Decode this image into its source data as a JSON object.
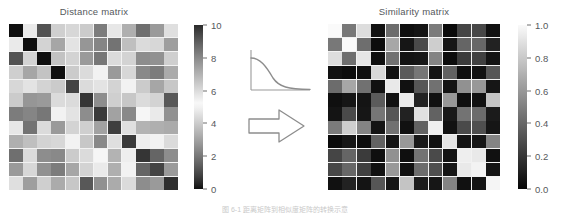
{
  "figure": {
    "caption_partial": "图 6-1 距离矩阵到相似度矩阵的转换示意"
  },
  "left_panel": {
    "title": "Distance matrix",
    "colorbar": {
      "name": "distance-colorbar",
      "ticks": [
        "10",
        "8",
        "6",
        "4",
        "2",
        "0"
      ],
      "tick_values": [
        10,
        8,
        6,
        4,
        2,
        0
      ],
      "vmin": 0,
      "vmax": 10
    }
  },
  "right_panel": {
    "title": "Similarity matrix",
    "colorbar": {
      "name": "similarity-colorbar",
      "ticks": [
        "1.0",
        "0.8",
        "0.6",
        "0.4",
        "0.2",
        "0.0"
      ],
      "tick_values": [
        1.0,
        0.8,
        0.6,
        0.4,
        0.2,
        0.0
      ],
      "vmin": 0.0,
      "vmax": 1.0
    }
  },
  "transform": {
    "kernel_icon": "decaying-kernel-curve",
    "arrow_icon": "right-block-arrow"
  },
  "chart_data": [
    {
      "type": "heatmap",
      "name": "distance-matrix",
      "title": "Distance matrix",
      "xlabel": "",
      "ylabel": "",
      "cmap": "gray-diverging-dark-light-dark",
      "vmin": 0,
      "vmax": 10,
      "colorbar_ticks": [
        0,
        2,
        4,
        6,
        8,
        10
      ],
      "rows": 12,
      "cols": 12,
      "values": [
        [
          0.0,
          5.6,
          1.2,
          6.3,
          6.1,
          6.4,
          8.3,
          4.7,
          3.3,
          8.6,
          7.6,
          5.9
        ],
        [
          5.6,
          0.0,
          6.2,
          7.3,
          4.6,
          7.7,
          8.1,
          1.9,
          6.7,
          6.0,
          6.1,
          7.5
        ],
        [
          1.2,
          6.2,
          0.0,
          6.6,
          6.2,
          7.6,
          8.4,
          4.4,
          4.2,
          7.9,
          7.8,
          6.3
        ],
        [
          6.3,
          7.3,
          6.6,
          0.0,
          4.0,
          6.0,
          5.4,
          7.6,
          6.1,
          2.4,
          2.1,
          7.2
        ],
        [
          6.1,
          4.6,
          6.2,
          4.0,
          0.9,
          6.0,
          5.8,
          6.2,
          5.0,
          4.0,
          3.1,
          6.5
        ],
        [
          6.4,
          7.7,
          7.6,
          6.0,
          6.0,
          0.6,
          7.9,
          6.3,
          6.5,
          6.0,
          6.2,
          1.3
        ],
        [
          8.3,
          8.1,
          8.4,
          5.4,
          5.8,
          7.9,
          0.7,
          7.4,
          8.0,
          5.1,
          5.6,
          7.8
        ],
        [
          4.7,
          1.9,
          4.4,
          7.6,
          6.2,
          6.3,
          7.4,
          0.8,
          5.9,
          7.0,
          7.1,
          7.2
        ],
        [
          3.3,
          6.7,
          4.2,
          6.1,
          5.0,
          6.5,
          8.0,
          5.9,
          0.7,
          5.5,
          5.4,
          6.0
        ],
        [
          8.6,
          6.0,
          7.9,
          2.4,
          4.0,
          6.0,
          5.1,
          7.0,
          5.5,
          0.6,
          1.6,
          7.9
        ],
        [
          7.6,
          6.1,
          7.8,
          2.1,
          3.1,
          6.2,
          5.6,
          7.1,
          5.4,
          1.6,
          0.9,
          7.6
        ],
        [
          5.9,
          7.5,
          6.3,
          7.2,
          6.5,
          1.3,
          7.8,
          7.2,
          6.0,
          7.9,
          7.6,
          0.5
        ]
      ]
    },
    {
      "type": "heatmap",
      "name": "similarity-matrix",
      "title": "Similarity matrix",
      "xlabel": "",
      "ylabel": "",
      "cmap": "gray",
      "vmin": 0.0,
      "vmax": 1.0,
      "colorbar_ticks": [
        0.0,
        0.2,
        0.4,
        0.6,
        0.8,
        1.0
      ],
      "rows": 12,
      "cols": 12,
      "values": [
        [
          1.0,
          0.47,
          0.88,
          0.05,
          0.42,
          0.04,
          0.06,
          0.48,
          0.02,
          0.26,
          0.27,
          0.05
        ],
        [
          0.47,
          1.0,
          0.43,
          0.03,
          0.66,
          0.07,
          0.28,
          0.82,
          0.07,
          0.39,
          0.4,
          0.12
        ],
        [
          0.88,
          0.43,
          0.92,
          0.04,
          0.44,
          0.06,
          0.07,
          0.52,
          0.03,
          0.22,
          0.24,
          0.06
        ],
        [
          0.05,
          0.03,
          0.04,
          0.86,
          0.05,
          0.35,
          0.46,
          0.06,
          0.38,
          0.04,
          0.05,
          0.33
        ],
        [
          0.42,
          0.66,
          0.44,
          0.05,
          0.93,
          0.05,
          0.33,
          0.44,
          0.06,
          0.57,
          0.6,
          0.07
        ],
        [
          0.04,
          0.07,
          0.06,
          0.35,
          0.05,
          0.94,
          0.12,
          0.05,
          0.6,
          0.04,
          0.05,
          0.78
        ],
        [
          0.06,
          0.28,
          0.07,
          0.46,
          0.33,
          0.12,
          0.9,
          0.38,
          0.08,
          0.45,
          0.42,
          0.09
        ],
        [
          0.48,
          0.82,
          0.52,
          0.06,
          0.44,
          0.05,
          0.38,
          0.96,
          0.05,
          0.28,
          0.3,
          0.07
        ],
        [
          0.02,
          0.07,
          0.03,
          0.38,
          0.06,
          0.6,
          0.08,
          0.05,
          0.91,
          0.06,
          0.07,
          0.52
        ],
        [
          0.26,
          0.39,
          0.22,
          0.04,
          0.57,
          0.04,
          0.45,
          0.28,
          0.06,
          0.95,
          0.93,
          0.05
        ],
        [
          0.27,
          0.4,
          0.24,
          0.05,
          0.6,
          0.05,
          0.42,
          0.3,
          0.07,
          0.93,
          0.97,
          0.06
        ],
        [
          0.05,
          0.12,
          0.06,
          0.33,
          0.07,
          0.78,
          0.09,
          0.07,
          0.52,
          0.05,
          0.06,
          0.98
        ]
      ]
    },
    {
      "type": "line",
      "name": "kernel-decay-curve",
      "title": "",
      "xlabel": "",
      "ylabel": "",
      "x": [
        0,
        0.1,
        0.2,
        0.3,
        0.4,
        0.5,
        0.6,
        0.7,
        0.8,
        0.9,
        1.0
      ],
      "values": [
        1.0,
        0.96,
        0.86,
        0.7,
        0.52,
        0.35,
        0.22,
        0.13,
        0.07,
        0.04,
        0.02
      ],
      "grid": false,
      "legend": null
    }
  ]
}
